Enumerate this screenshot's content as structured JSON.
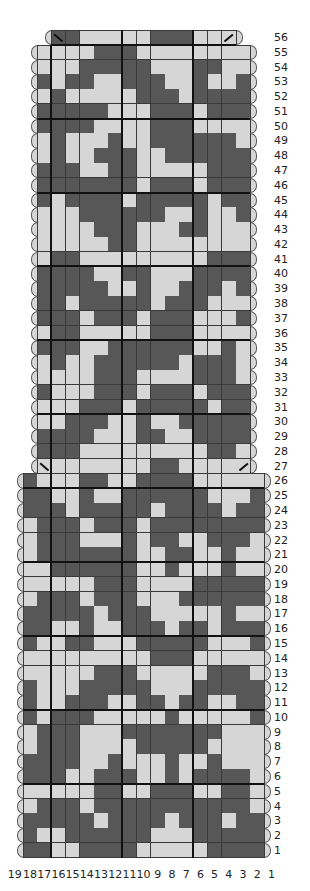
{
  "chart": {
    "title": "",
    "colors": {
      "dark": "#575757",
      "light": "#d6d6d6",
      "grid": "#3a3a3a",
      "thick": "#111111"
    },
    "legend": {
      "D": "dark",
      "L": "light"
    },
    "column_labels": [
      "19",
      "18",
      "17",
      "16",
      "15",
      "14",
      "13",
      "12",
      "11",
      "10",
      "9",
      "8",
      "7",
      "6",
      "5",
      "4",
      "3",
      "2",
      "1"
    ],
    "rows": [
      {
        "n": "56",
        "from": 16,
        "to": 4,
        "cells": "DDLLLLLDDDLLL",
        "slash_left": true,
        "slash_right": true
      },
      {
        "n": "55",
        "from": 17,
        "to": 3,
        "cells": "LLLLDDDLLLLLLLL"
      },
      {
        "n": "54",
        "from": 17,
        "to": 3,
        "cells": "LLLDDDDDLLLDDLL"
      },
      {
        "n": "53",
        "from": 17,
        "to": 3,
        "cells": "DLDDLLDDDLLDLLD"
      },
      {
        "n": "52",
        "from": 17,
        "to": 3,
        "cells": "LDLLLLLDDDLDDDD"
      },
      {
        "n": "51",
        "from": 17,
        "to": 3,
        "cells": "DDDDDLLLDDDLDDD"
      },
      {
        "n": "50",
        "from": 17,
        "to": 3,
        "cells": "DDDDLLLLDDDLLLL"
      },
      {
        "n": "49",
        "from": 17,
        "to": 3,
        "cells": "LDLLLDLLDDDDDDL"
      },
      {
        "n": "48",
        "from": 17,
        "to": 3,
        "cells": "LDLLDDDLLDDDDDD"
      },
      {
        "n": "47",
        "from": 17,
        "to": 3,
        "cells": "DDDLLDDLLLLLDDD"
      },
      {
        "n": "46",
        "from": 17,
        "to": 3,
        "cells": "DDDDDDDLDDDLDDD"
      },
      {
        "n": "45",
        "from": 17,
        "to": 3,
        "cells": "DLDDDDLDDDDDLDD"
      },
      {
        "n": "44",
        "from": 17,
        "to": 3,
        "cells": "LLLDDDDDDLLDLLD"
      },
      {
        "n": "43",
        "from": 17,
        "to": 3,
        "cells": "LLLLDDDLLLDDLLL"
      },
      {
        "n": "42",
        "from": 17,
        "to": 3,
        "cells": "LLLLLDDLLLLLLLL"
      },
      {
        "n": "41",
        "from": 17,
        "to": 3,
        "cells": "LDDLLLLLLLLLDDD"
      },
      {
        "n": "40",
        "from": 17,
        "to": 3,
        "cells": "DDDDLLDDLLLDDDD"
      },
      {
        "n": "39",
        "from": 17,
        "to": 3,
        "cells": "DDDDDLLDLLDDDLD"
      },
      {
        "n": "38",
        "from": 17,
        "to": 3,
        "cells": "DDLDDDDDLDDDLLL"
      },
      {
        "n": "37",
        "from": 17,
        "to": 3,
        "cells": "DDDLDDDLDDDLLLD"
      },
      {
        "n": "36",
        "from": 17,
        "to": 3,
        "cells": "LDDLLLLLDDDLLLL"
      },
      {
        "n": "35",
        "from": 17,
        "to": 3,
        "cells": "DDDLLDDDDDDLLDL"
      },
      {
        "n": "34",
        "from": 17,
        "to": 3,
        "cells": "LDLLDDDDDDLDDDL"
      },
      {
        "n": "33",
        "from": 17,
        "to": 3,
        "cells": "LLLLDDDLLLLDDDL"
      },
      {
        "n": "32",
        "from": 17,
        "to": 3,
        "cells": "DLLLDDDLDDDLDDD"
      },
      {
        "n": "31",
        "from": 17,
        "to": 3,
        "cells": "LLLDDDLDDDDDLDD"
      },
      {
        "n": "30",
        "from": 17,
        "to": 3,
        "cells": "LLDDDLLDLLDDDDD"
      },
      {
        "n": "29",
        "from": 17,
        "to": 3,
        "cells": "DDDDLLLDDLLDDDD"
      },
      {
        "n": "28",
        "from": 17,
        "to": 3,
        "cells": "DDDLLLLLLLLLDDL"
      },
      {
        "n": "27",
        "from": 17,
        "to": 3,
        "cells": "LLLLLLLLDDLLLLL",
        "slash_left": true,
        "slash_right": true,
        "no_caps": true
      },
      {
        "n": "26",
        "from": 18,
        "to": 2,
        "cells": "DLLLDDLLDDDDLLLLL"
      },
      {
        "n": "25",
        "from": 18,
        "to": 2,
        "cells": "DDLLDLLDDDDDDLLLD"
      },
      {
        "n": "24",
        "from": 18,
        "to": 2,
        "cells": "DDDLDDDDDLDDDDLDD"
      },
      {
        "n": "23",
        "from": 18,
        "to": 2,
        "cells": "LDDDLDDDLDDDDDDDD"
      },
      {
        "n": "22",
        "from": 18,
        "to": 2,
        "cells": "LDDDLLLDLDDLLDDDL"
      },
      {
        "n": "21",
        "from": 18,
        "to": 2,
        "cells": "LDDDDDDDLLDDLLDLL"
      },
      {
        "n": "20",
        "from": 18,
        "to": 2,
        "cells": "LLDDDDDDLLDLLLDLL"
      },
      {
        "n": "19",
        "from": 18,
        "to": 2,
        "cells": "LLLLLDDDLLLLDDDDD"
      },
      {
        "n": "18",
        "from": 18,
        "to": 2,
        "cells": "LDDDLDDDLLLDDDDDD"
      },
      {
        "n": "17",
        "from": 18,
        "to": 2,
        "cells": "DDDDDLDDDLLLLLDLL"
      },
      {
        "n": "16",
        "from": 18,
        "to": 2,
        "cells": "DDLLDLLDDDLDDLDDD"
      },
      {
        "n": "15",
        "from": 18,
        "to": 2,
        "cells": "DLLDDLLLDDDDDLLLD"
      },
      {
        "n": "14",
        "from": 18,
        "to": 2,
        "cells": "LLLLLLLLLDDDLLLLL"
      },
      {
        "n": "13",
        "from": 18,
        "to": 2,
        "cells": "LLLLLDDDLLLLLDDDL"
      },
      {
        "n": "12",
        "from": 18,
        "to": 2,
        "cells": "DLLLDDDDDLLLDDDDD"
      },
      {
        "n": "11",
        "from": 18,
        "to": 2,
        "cells": "DLLDDDLLDDLDDLLDD"
      },
      {
        "n": "10",
        "from": 18,
        "to": 2,
        "cells": "DLDDDLLLLLDLLLLLD"
      },
      {
        "n": "9",
        "from": 18,
        "to": 2,
        "cells": "LDDDLLLDDDDDDDLLL"
      },
      {
        "n": "8",
        "from": 18,
        "to": 2,
        "cells": "LDDDLLLLDDDDDLLLL"
      },
      {
        "n": "7",
        "from": 18,
        "to": 2,
        "cells": "DDDDLLDLLLDLLDLLL"
      },
      {
        "n": "6",
        "from": 18,
        "to": 2,
        "cells": "DDDLLDDDLLDLDDDDL"
      },
      {
        "n": "5",
        "from": 18,
        "to": 2,
        "cells": "LLLLLDDLLDDDLLDDL"
      },
      {
        "n": "4",
        "from": 18,
        "to": 2,
        "cells": "LDDDLDDDDDDDDDDDL"
      },
      {
        "n": "3",
        "from": 18,
        "to": 2,
        "cells": "DDDDDLDDDDLDDDLDD"
      },
      {
        "n": "2",
        "from": 18,
        "to": 2,
        "cells": "DLLDDDDDDLLLDDDDD"
      },
      {
        "n": "1",
        "from": 18,
        "to": 2,
        "cells": "DDLLDDDDLLLLLDDDD"
      }
    ]
  }
}
